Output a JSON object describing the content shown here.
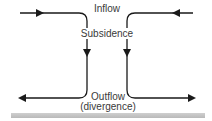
{
  "diagram": {
    "labels": {
      "inflow": "Inflow",
      "subsidence": "Subsidence",
      "outflow": "Outflow",
      "divergence": "(divergence)"
    },
    "colors": {
      "line": "#1a1a1a",
      "text": "#3a3a3a",
      "ground": "#c4c4c4"
    },
    "flows": [
      {
        "name": "left-inflow",
        "direction": "right"
      },
      {
        "name": "right-inflow",
        "direction": "left"
      },
      {
        "name": "left-subsidence",
        "direction": "down"
      },
      {
        "name": "right-subsidence",
        "direction": "down"
      },
      {
        "name": "left-outflow",
        "direction": "left"
      },
      {
        "name": "right-outflow",
        "direction": "right"
      }
    ]
  }
}
